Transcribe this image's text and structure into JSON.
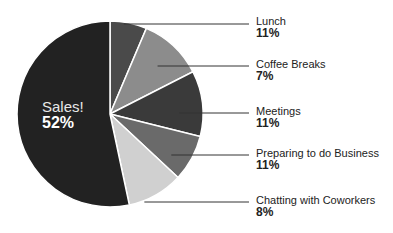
{
  "chart_data": {
    "type": "pie",
    "title": "",
    "slices": [
      {
        "label": "Lunch",
        "value": 11,
        "display": "11%",
        "color": "#4a4a4a",
        "start_deg": 0,
        "end_deg": 23,
        "label_y": 15
      },
      {
        "label": "Coffee Breaks",
        "value": 7,
        "display": "7%",
        "color": "#8c8c8c",
        "start_deg": 23,
        "end_deg": 63,
        "label_y": 57
      },
      {
        "label": "Meetings",
        "value": 11,
        "display": "11%",
        "color": "#3a3a3a",
        "start_deg": 63,
        "end_deg": 104,
        "label_y": 104
      },
      {
        "label": "Preparing to do Business",
        "value": 11,
        "display": "11%",
        "color": "#6a6a6a",
        "start_deg": 104,
        "end_deg": 133,
        "label_y": 146
      },
      {
        "label": "Chatting with Coworkers",
        "value": 8,
        "display": "8%",
        "color": "#d0d0d0",
        "start_deg": 133,
        "end_deg": 168,
        "label_y": 193
      },
      {
        "label": "Sales!",
        "value": 52,
        "display": "52%",
        "color": "#222222",
        "start_deg": 168,
        "end_deg": 360
      }
    ],
    "center": [
      110,
      114
    ],
    "radius": 93,
    "legend_position": "right, leader lines"
  },
  "labels": {
    "lunch": {
      "name": "Lunch",
      "pct": "11%"
    },
    "coffee": {
      "name": "Coffee Breaks",
      "pct": "7%"
    },
    "meetings": {
      "name": "Meetings",
      "pct": "11%"
    },
    "preparing": {
      "name": "Preparing to do Business",
      "pct": "11%"
    },
    "chatting": {
      "name": "Chatting with Coworkers",
      "pct": "8%"
    },
    "sales": {
      "name": "Sales!",
      "pct": "52%"
    }
  }
}
